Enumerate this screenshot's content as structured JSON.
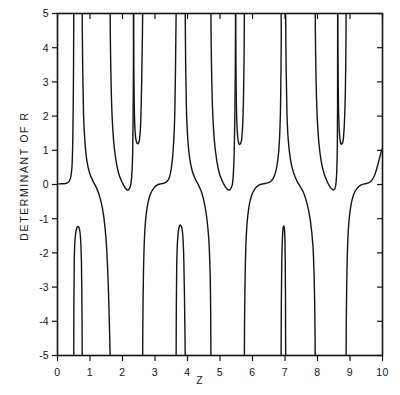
{
  "figure": {
    "background": "#fefefe",
    "ink_color": "#141414"
  },
  "chart_data": {
    "type": "line",
    "title": "",
    "xlabel": "Z",
    "ylabel": "DETERMINANT OF R",
    "xlim": [
      0,
      10
    ],
    "ylim": [
      -5,
      5
    ],
    "grid": false,
    "legend": null,
    "xticks": [
      0,
      1,
      2,
      3,
      4,
      5,
      6,
      7,
      8,
      9,
      10
    ],
    "xtick_labels": [
      "0",
      "1",
      "2",
      "3",
      "4",
      "5",
      "6",
      "7",
      "8",
      "9",
      "10"
    ],
    "yticks": [
      -5,
      -4,
      -3,
      -2,
      -1,
      0,
      1,
      2,
      3,
      4,
      5
    ],
    "ytick_labels": [
      "-5",
      "-4",
      "-3",
      "-2",
      "-1",
      "0",
      "1",
      "2",
      "3",
      "4",
      "5"
    ],
    "axis_box": true,
    "tick_direction": "inward-top-right / outward-bottom-left",
    "line_color": "#141414",
    "line_width": 1.4,
    "poles": [
      0.5,
      0.76,
      1.62,
      2.34,
      2.62,
      3.65,
      3.93,
      4.72,
      5.48,
      5.75,
      6.88,
      7.02,
      7.93,
      8.62,
      8.88
    ],
    "spike_minima": [
      {
        "z": 2.48,
        "value": 1.22
      },
      {
        "z": 5.62,
        "value": 1.18
      },
      {
        "z": 8.75,
        "value": 1.2
      }
    ],
    "spike_maxima": [
      {
        "z": 0.63,
        "value": -1.22
      },
      {
        "z": 3.79,
        "value": -1.18
      },
      {
        "z": 6.95,
        "value": -1.22
      }
    ],
    "plateau_level_upper": 0.0,
    "plateau_level_lower": -1.25,
    "series": [
      {
        "name": "determinant of R",
        "points_note": "Traced branch-by-branch between successive poles; see 'branches' for polyline vertex lists in data coordinates."
      }
    ],
    "branches": [
      [
        [
          0.0,
          0.02
        ],
        [
          0.12,
          0.02
        ],
        [
          0.24,
          0.03
        ],
        [
          0.32,
          0.06
        ],
        [
          0.38,
          0.13
        ],
        [
          0.42,
          0.28
        ],
        [
          0.45,
          0.6
        ],
        [
          0.47,
          1.3
        ],
        [
          0.485,
          2.4
        ],
        [
          0.495,
          3.7
        ],
        [
          0.5,
          5.0
        ]
      ],
      [
        [
          0.5,
          -5.0
        ],
        [
          0.505,
          -3.4
        ],
        [
          0.515,
          -2.3
        ],
        [
          0.53,
          -1.75
        ],
        [
          0.56,
          -1.42
        ],
        [
          0.6,
          -1.26
        ],
        [
          0.64,
          -1.23
        ],
        [
          0.68,
          -1.32
        ],
        [
          0.71,
          -1.58
        ],
        [
          0.735,
          -2.2
        ],
        [
          0.748,
          -3.1
        ],
        [
          0.756,
          -4.1
        ],
        [
          0.76,
          -5.0
        ]
      ],
      [
        [
          0.76,
          5.0
        ],
        [
          0.775,
          3.4
        ],
        [
          0.8,
          2.1
        ],
        [
          0.84,
          1.3
        ],
        [
          0.9,
          0.72
        ],
        [
          0.98,
          0.36
        ],
        [
          1.08,
          0.12
        ],
        [
          1.18,
          -0.06
        ],
        [
          1.26,
          -0.24
        ],
        [
          1.34,
          -0.5
        ],
        [
          1.42,
          -0.92
        ],
        [
          1.49,
          -1.55
        ],
        [
          1.545,
          -2.5
        ],
        [
          1.58,
          -3.5
        ],
        [
          1.605,
          -4.4
        ],
        [
          1.62,
          -5.0
        ]
      ],
      [
        [
          1.62,
          5.0
        ],
        [
          1.63,
          4.0
        ],
        [
          1.65,
          2.9
        ],
        [
          1.68,
          2.0
        ],
        [
          1.73,
          1.25
        ],
        [
          1.8,
          0.7
        ],
        [
          1.88,
          0.33
        ],
        [
          1.98,
          0.08
        ],
        [
          2.06,
          -0.06
        ],
        [
          2.12,
          -0.14
        ],
        [
          2.16,
          -0.16
        ],
        [
          2.2,
          -0.14
        ],
        [
          2.24,
          -0.06
        ],
        [
          2.27,
          0.1
        ],
        [
          2.295,
          0.42
        ],
        [
          2.315,
          1.0
        ],
        [
          2.328,
          2.1
        ],
        [
          2.336,
          3.4
        ],
        [
          2.34,
          5.0
        ]
      ],
      [
        [
          2.34,
          5.0
        ],
        [
          2.345,
          3.9
        ],
        [
          2.355,
          2.8
        ],
        [
          2.372,
          1.9
        ],
        [
          2.4,
          1.4
        ],
        [
          2.44,
          1.22
        ],
        [
          2.48,
          1.2
        ],
        [
          2.52,
          1.3
        ],
        [
          2.555,
          1.7
        ],
        [
          2.58,
          2.5
        ],
        [
          2.6,
          3.6
        ],
        [
          2.615,
          4.5
        ],
        [
          2.62,
          5.0
        ]
      ],
      [
        [
          2.62,
          -5.0
        ],
        [
          2.628,
          -3.8
        ],
        [
          2.645,
          -2.6
        ],
        [
          2.67,
          -1.7
        ],
        [
          2.71,
          -1.05
        ],
        [
          2.77,
          -0.6
        ],
        [
          2.85,
          -0.3
        ],
        [
          2.95,
          -0.12
        ],
        [
          3.06,
          -0.02
        ],
        [
          3.18,
          0.02
        ],
        [
          3.28,
          0.04
        ],
        [
          3.36,
          0.08
        ],
        [
          3.44,
          0.2
        ],
        [
          3.5,
          0.46
        ],
        [
          3.555,
          0.95
        ],
        [
          3.6,
          1.8
        ],
        [
          3.625,
          3.0
        ],
        [
          3.64,
          4.2
        ],
        [
          3.65,
          5.0
        ]
      ],
      [
        [
          3.65,
          -5.0
        ],
        [
          3.657,
          -3.5
        ],
        [
          3.668,
          -2.4
        ],
        [
          3.685,
          -1.8
        ],
        [
          3.715,
          -1.4
        ],
        [
          3.75,
          -1.22
        ],
        [
          3.79,
          -1.19
        ],
        [
          3.83,
          -1.28
        ],
        [
          3.86,
          -1.55
        ],
        [
          3.885,
          -2.15
        ],
        [
          3.903,
          -3.05
        ],
        [
          3.918,
          -4.1
        ],
        [
          3.93,
          -5.0
        ]
      ],
      [
        [
          3.93,
          5.0
        ],
        [
          3.945,
          3.4
        ],
        [
          3.97,
          2.1
        ],
        [
          4.01,
          1.3
        ],
        [
          4.07,
          0.75
        ],
        [
          4.15,
          0.38
        ],
        [
          4.25,
          0.14
        ],
        [
          4.35,
          -0.04
        ],
        [
          4.43,
          -0.22
        ],
        [
          4.51,
          -0.5
        ],
        [
          4.59,
          -0.95
        ],
        [
          4.655,
          -1.6
        ],
        [
          4.695,
          -2.55
        ],
        [
          4.712,
          -3.6
        ],
        [
          4.72,
          -5.0
        ]
      ],
      [
        [
          4.72,
          5.0
        ],
        [
          4.73,
          4.0
        ],
        [
          4.75,
          2.9
        ],
        [
          4.78,
          2.0
        ],
        [
          4.83,
          1.25
        ],
        [
          4.9,
          0.7
        ],
        [
          4.98,
          0.33
        ],
        [
          5.08,
          0.08
        ],
        [
          5.16,
          -0.06
        ],
        [
          5.23,
          -0.14
        ],
        [
          5.28,
          -0.16
        ],
        [
          5.33,
          -0.12
        ],
        [
          5.38,
          0.0
        ],
        [
          5.41,
          0.3
        ],
        [
          5.435,
          0.85
        ],
        [
          5.455,
          1.9
        ],
        [
          5.47,
          3.3
        ],
        [
          5.48,
          5.0
        ]
      ],
      [
        [
          5.48,
          5.0
        ],
        [
          5.487,
          3.9
        ],
        [
          5.498,
          2.8
        ],
        [
          5.515,
          1.9
        ],
        [
          5.545,
          1.38
        ],
        [
          5.58,
          1.2
        ],
        [
          5.62,
          1.18
        ],
        [
          5.66,
          1.28
        ],
        [
          5.695,
          1.68
        ],
        [
          5.722,
          2.5
        ],
        [
          5.74,
          3.6
        ],
        [
          5.75,
          5.0
        ]
      ],
      [
        [
          5.75,
          -5.0
        ],
        [
          5.758,
          -3.8
        ],
        [
          5.775,
          -2.6
        ],
        [
          5.8,
          -1.7
        ],
        [
          5.84,
          -1.05
        ],
        [
          5.9,
          -0.6
        ],
        [
          5.98,
          -0.3
        ],
        [
          6.08,
          -0.12
        ],
        [
          6.2,
          -0.02
        ],
        [
          6.32,
          0.02
        ],
        [
          6.44,
          0.04
        ],
        [
          6.55,
          0.08
        ],
        [
          6.65,
          0.2
        ],
        [
          6.74,
          0.48
        ],
        [
          6.81,
          1.0
        ],
        [
          6.855,
          1.95
        ],
        [
          6.875,
          3.2
        ],
        [
          6.885,
          4.3
        ],
        [
          6.88,
          5.0
        ]
      ],
      [
        [
          6.88,
          -5.0
        ],
        [
          6.888,
          -3.4
        ],
        [
          6.9,
          -2.3
        ],
        [
          6.915,
          -1.72
        ],
        [
          6.932,
          -1.38
        ],
        [
          6.952,
          -1.23
        ],
        [
          6.968,
          -1.22
        ],
        [
          6.985,
          -1.32
        ],
        [
          6.998,
          -1.62
        ],
        [
          7.008,
          -2.3
        ],
        [
          7.015,
          -3.3
        ],
        [
          7.02,
          -5.0
        ]
      ],
      [
        [
          7.02,
          5.0
        ],
        [
          7.035,
          3.4
        ],
        [
          7.06,
          2.1
        ],
        [
          7.1,
          1.3
        ],
        [
          7.17,
          0.72
        ],
        [
          7.26,
          0.35
        ],
        [
          7.37,
          0.1
        ],
        [
          7.48,
          -0.08
        ],
        [
          7.58,
          -0.26
        ],
        [
          7.68,
          -0.56
        ],
        [
          7.78,
          -1.05
        ],
        [
          7.86,
          -1.8
        ],
        [
          7.9,
          -2.8
        ],
        [
          7.92,
          -4.0
        ],
        [
          7.93,
          -5.0
        ]
      ],
      [
        [
          7.93,
          5.0
        ],
        [
          7.94,
          4.0
        ],
        [
          7.96,
          2.9
        ],
        [
          7.99,
          2.0
        ],
        [
          8.04,
          1.25
        ],
        [
          8.11,
          0.7
        ],
        [
          8.2,
          0.33
        ],
        [
          8.3,
          0.08
        ],
        [
          8.38,
          -0.06
        ],
        [
          8.45,
          -0.14
        ],
        [
          8.5,
          -0.16
        ],
        [
          8.545,
          -0.1
        ],
        [
          8.575,
          0.1
        ],
        [
          8.595,
          0.45
        ],
        [
          8.61,
          1.1
        ],
        [
          8.617,
          2.3
        ],
        [
          8.62,
          5.0
        ]
      ],
      [
        [
          8.62,
          5.0
        ],
        [
          8.627,
          3.9
        ],
        [
          8.638,
          2.8
        ],
        [
          8.655,
          1.9
        ],
        [
          8.685,
          1.38
        ],
        [
          8.715,
          1.2
        ],
        [
          8.75,
          1.19
        ],
        [
          8.79,
          1.3
        ],
        [
          8.825,
          1.75
        ],
        [
          8.855,
          2.6
        ],
        [
          8.872,
          3.7
        ],
        [
          8.88,
          5.0
        ]
      ],
      [
        [
          8.88,
          -5.0
        ],
        [
          8.888,
          -3.8
        ],
        [
          8.905,
          -2.6
        ],
        [
          8.93,
          -1.7
        ],
        [
          8.97,
          -1.05
        ],
        [
          9.03,
          -0.6
        ],
        [
          9.11,
          -0.3
        ],
        [
          9.21,
          -0.12
        ],
        [
          9.33,
          -0.02
        ],
        [
          9.45,
          0.02
        ],
        [
          9.57,
          0.05
        ],
        [
          9.67,
          0.12
        ],
        [
          9.76,
          0.28
        ],
        [
          9.84,
          0.52
        ],
        [
          9.91,
          0.78
        ],
        [
          9.96,
          0.95
        ],
        [
          10.0,
          1.05
        ]
      ]
    ]
  }
}
